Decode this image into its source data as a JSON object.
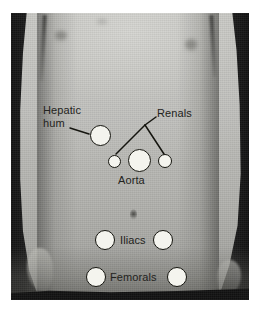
{
  "figure": {
    "type": "annotated-photograph",
    "canvas": {
      "width": 265,
      "height": 313,
      "background": "#ffffff"
    },
    "photo": {
      "left": 11,
      "top": 13,
      "width": 238,
      "height": 287,
      "rendering": "grayscale"
    },
    "colors": {
      "marker_fill": "#f4f4ee",
      "marker_stroke": "#15150f",
      "label_text": "#232320",
      "leader_line": "#15150f",
      "photo_background_dark": "#141414",
      "skin_midtone": "#bcbcb8"
    }
  },
  "labels": [
    {
      "id": "hepatic-hum",
      "text": "Hepatic\nhum",
      "x": 43,
      "y": 110
    },
    {
      "id": "renals",
      "text": "Renals",
      "x": 150,
      "y": 113
    },
    {
      "id": "aorta",
      "text": "Aorta",
      "x": 118,
      "y": 176
    },
    {
      "id": "iliacs",
      "text": "Iliacs",
      "x": 122,
      "y": 234
    },
    {
      "id": "femorals",
      "text": "Femorals",
      "x": 111,
      "y": 271
    }
  ],
  "sites": [
    {
      "id": "hepatic-hum-site",
      "label": "Hepatic hum",
      "cx": 100,
      "cy": 135,
      "d": 21
    },
    {
      "id": "renal-left-site",
      "label": "Renal (left)",
      "cx": 114,
      "cy": 161,
      "d": 13
    },
    {
      "id": "aorta-site",
      "label": "Aorta",
      "cx": 139,
      "cy": 160,
      "d": 23
    },
    {
      "id": "renal-right-site",
      "label": "Renal (right)",
      "cx": 165,
      "cy": 161,
      "d": 14
    },
    {
      "id": "iliac-left-site",
      "label": "Iliac (left)",
      "cx": 105,
      "cy": 240,
      "d": 20
    },
    {
      "id": "iliac-right-site",
      "label": "Iliac (right)",
      "cx": 163,
      "cy": 240,
      "d": 20
    },
    {
      "id": "femoral-left-site",
      "label": "Femoral (left)",
      "cx": 96,
      "cy": 277,
      "d": 20
    },
    {
      "id": "femoral-right-site",
      "label": "Femoral (right)",
      "cx": 177,
      "cy": 277,
      "d": 20
    }
  ],
  "leaders": [
    {
      "id": "hepatic-leader",
      "from": "hepatic-hum-label",
      "to": "hepatic-hum-site",
      "points": "70,128 89,134"
    },
    {
      "id": "renal-apex-stub",
      "from": "renals-label",
      "to": "renal-apex",
      "points": "145,124 155,118"
    },
    {
      "id": "renal-left-leader",
      "from": "renal-apex",
      "to": "renal-left-site",
      "points": "145,125 116,154"
    },
    {
      "id": "renal-right-leader",
      "from": "renal-apex",
      "to": "renal-right-site",
      "points": "145,125 164,154"
    }
  ]
}
